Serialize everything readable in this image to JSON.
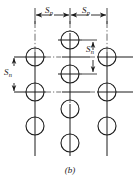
{
  "figure": {
    "caption": "(b)",
    "diagram_type": "staggered-fastener-pattern",
    "colors": {
      "line": "#1a1a1a",
      "centerline": "#4a4a4a",
      "background": "#ffffff",
      "text": "#1a1a1a"
    },
    "dimensions": [
      {
        "id": "pitch-left",
        "symbol": "S",
        "subscript": "p",
        "orientation": "horizontal",
        "label_x": 47,
        "label_y": 12
      },
      {
        "id": "pitch-right",
        "symbol": "S",
        "subscript": "p",
        "orientation": "horizontal",
        "label_x": 84,
        "label_y": 12
      },
      {
        "id": "gage-right",
        "symbol": "S",
        "subscript": "n",
        "orientation": "vertical",
        "label_x": 88,
        "label_y": 51
      },
      {
        "id": "gage-left",
        "symbol": "S",
        "subscript": "n",
        "orientation": "vertical",
        "label_x": 6,
        "label_y": 70
      }
    ],
    "columns": [
      {
        "id": "column-left",
        "x": 35
      },
      {
        "id": "column-middle",
        "x": 70
      },
      {
        "id": "column-right",
        "x": 107
      }
    ],
    "rows": [
      {
        "id": "row-upper",
        "y": 57
      },
      {
        "id": "row-lower",
        "y": 92
      }
    ],
    "holes": [
      {
        "id": "hole-left-upper",
        "cx": 35,
        "cy": 57,
        "r": 9
      },
      {
        "id": "hole-left-lower",
        "cx": 35,
        "cy": 92,
        "r": 9
      },
      {
        "id": "hole-left-bottom",
        "cx": 35,
        "cy": 126,
        "r": 9
      },
      {
        "id": "hole-middle-top",
        "cx": 70,
        "cy": 40,
        "r": 9
      },
      {
        "id": "hole-middle-upper",
        "cx": 70,
        "cy": 74,
        "r": 9
      },
      {
        "id": "hole-middle-lower",
        "cx": 70,
        "cy": 109,
        "r": 9
      },
      {
        "id": "hole-middle-bottom",
        "cx": 70,
        "cy": 143,
        "r": 9
      },
      {
        "id": "hole-right-upper",
        "cx": 107,
        "cy": 57,
        "r": 9
      },
      {
        "id": "hole-right-lower",
        "cx": 107,
        "cy": 92,
        "r": 9
      },
      {
        "id": "hole-right-bottom",
        "cx": 107,
        "cy": 126,
        "r": 9
      }
    ]
  }
}
